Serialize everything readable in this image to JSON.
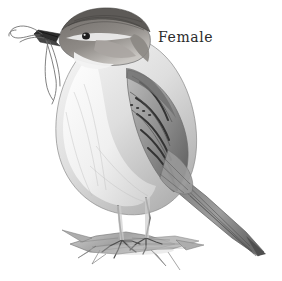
{
  "image": {
    "subject": "house-sparrow",
    "subject_description": "Pencil drawing of a female house sparrow perched on a twig holding nesting grass in its beak",
    "medium": "graphite-pencil-drawing",
    "background_color": "#ffffff",
    "width": 282,
    "height": 281
  },
  "caption": {
    "text": "Female"
  },
  "palette": {
    "ink_dark": "#2b2b2b",
    "crown_dark": "#5d5a57",
    "wing_bar_dark": "#3a3a3a",
    "body_mid_gray": "#9a9a9a",
    "breast_light": "#e8e8e8",
    "perch_gray": "#8e8e8e",
    "paper_white": "#ffffff"
  },
  "parts": [
    {
      "name": "crown",
      "label": "Crown"
    },
    {
      "name": "eye",
      "label": "Eye"
    },
    {
      "name": "beak",
      "label": "Beak"
    },
    {
      "name": "nesting-material",
      "label": "Nesting grass"
    },
    {
      "name": "breast",
      "label": "Breast"
    },
    {
      "name": "wing",
      "label": "Wing"
    },
    {
      "name": "tail",
      "label": "Tail"
    },
    {
      "name": "legs",
      "label": "Legs"
    },
    {
      "name": "perch",
      "label": "Perch twig"
    }
  ]
}
